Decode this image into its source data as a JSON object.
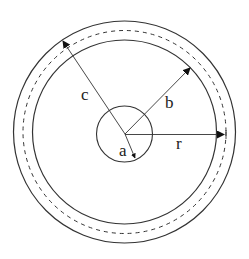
{
  "diagram": {
    "labels": {
      "a": "a",
      "b": "b",
      "c": "c",
      "r": "r"
    },
    "circles": [
      {
        "name": "inner-core",
        "r": 28,
        "style": "solid"
      },
      {
        "name": "inner-boundary",
        "r": 92,
        "style": "solid"
      },
      {
        "name": "middle-dashed",
        "r": 101,
        "style": "dashed"
      },
      {
        "name": "outer-boundary",
        "r": 111,
        "style": "solid"
      }
    ],
    "line_color": "#333333"
  }
}
